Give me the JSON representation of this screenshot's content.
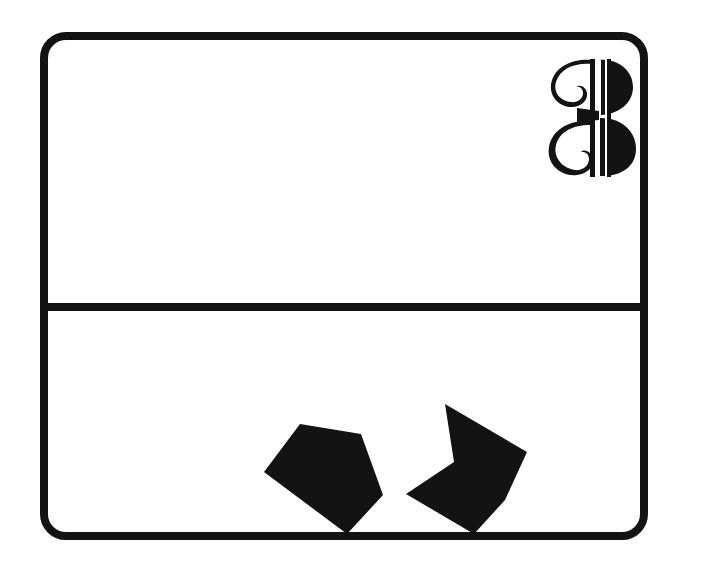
{
  "figure": {
    "kind": "line-drawing-panel",
    "background_color": "#ffffff",
    "ink_color": "#131313",
    "frame": {
      "name": "rounded-rectangle-border",
      "x": 40,
      "y": 32,
      "width": 608,
      "height": 508,
      "stroke_width": 8,
      "corner_radius": 26
    },
    "divider": {
      "name": "horizontal-rule",
      "x": 40,
      "y": 303,
      "width": 608,
      "thickness": 8,
      "orientation": "horizontal"
    },
    "panels": [
      {
        "id": "top",
        "label": "",
        "x": 48,
        "y": 40,
        "width": 592,
        "height": 263,
        "content": "empty"
      },
      {
        "id": "bottom",
        "label": "",
        "x": 48,
        "y": 311,
        "width": 592,
        "height": 221,
        "content": "two-black-polygons"
      }
    ]
  },
  "numeral": {
    "character": "3",
    "style": "ornate-decorative-blackletter",
    "name": "figure-number-3",
    "x": 543,
    "y": 54,
    "width": 96,
    "height": 126,
    "color": "#131313"
  },
  "shapes": [
    {
      "id": "left-polygon",
      "name": "black-pentagon",
      "type": "convex-pentagon",
      "vertex_count": 5,
      "fill": "#131313",
      "points": "300,424 361,434 383,495 347,534 264,472",
      "touches": "bottom-border"
    },
    {
      "id": "right-polygon",
      "name": "black-arrow-chevron",
      "type": "concave-hexagon",
      "vertex_count": 6,
      "fill": "#131313",
      "points": "445,404 527,452 505,500 474,534 406,494 454,462",
      "touches": "bottom-border"
    }
  ],
  "icons": {
    "numeral_icon_name": "ornate-numeral-3-icon",
    "pentagon_icon_name": "pentagon-shape-icon",
    "chevron_icon_name": "chevron-shape-icon"
  }
}
